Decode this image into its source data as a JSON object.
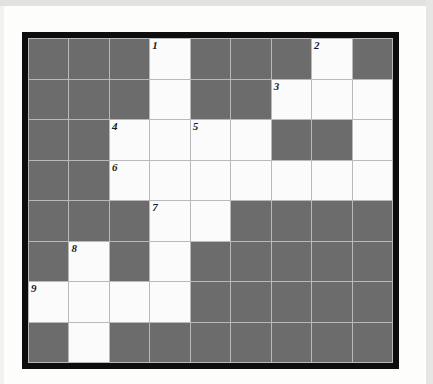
{
  "puzzle": {
    "type": "crossword-grid",
    "columns": 9,
    "rows": 8,
    "colors": {
      "block": "#6c6c6c",
      "open": "#fbfbfb",
      "gridline": "#b9b9b9",
      "frame": "#0d0d0d",
      "page": "#fdfdfb",
      "number_text": "#1a1a1a"
    },
    "clue_numbers": [
      "1",
      "2",
      "3",
      "4",
      "5",
      "6",
      "7",
      "8",
      "9"
    ],
    "rows_data": [
      {
        "index": 0,
        "cells": [
          {
            "state": "block",
            "number": ""
          },
          {
            "state": "block",
            "number": ""
          },
          {
            "state": "block",
            "number": ""
          },
          {
            "state": "open",
            "number": "1"
          },
          {
            "state": "block",
            "number": ""
          },
          {
            "state": "block",
            "number": ""
          },
          {
            "state": "block",
            "number": ""
          },
          {
            "state": "open",
            "number": "2"
          },
          {
            "state": "block",
            "number": ""
          }
        ]
      },
      {
        "index": 1,
        "cells": [
          {
            "state": "block",
            "number": ""
          },
          {
            "state": "block",
            "number": ""
          },
          {
            "state": "block",
            "number": ""
          },
          {
            "state": "open",
            "number": ""
          },
          {
            "state": "block",
            "number": ""
          },
          {
            "state": "block",
            "number": ""
          },
          {
            "state": "open",
            "number": "3"
          },
          {
            "state": "open",
            "number": ""
          },
          {
            "state": "open",
            "number": ""
          }
        ]
      },
      {
        "index": 2,
        "cells": [
          {
            "state": "block",
            "number": ""
          },
          {
            "state": "block",
            "number": ""
          },
          {
            "state": "open",
            "number": "4"
          },
          {
            "state": "open",
            "number": ""
          },
          {
            "state": "open",
            "number": "5"
          },
          {
            "state": "open",
            "number": ""
          },
          {
            "state": "block",
            "number": ""
          },
          {
            "state": "block",
            "number": ""
          },
          {
            "state": "open",
            "number": ""
          }
        ]
      },
      {
        "index": 3,
        "cells": [
          {
            "state": "block",
            "number": ""
          },
          {
            "state": "block",
            "number": ""
          },
          {
            "state": "open",
            "number": "6"
          },
          {
            "state": "open",
            "number": ""
          },
          {
            "state": "open",
            "number": ""
          },
          {
            "state": "open",
            "number": ""
          },
          {
            "state": "open",
            "number": ""
          },
          {
            "state": "open",
            "number": ""
          },
          {
            "state": "open",
            "number": ""
          }
        ]
      },
      {
        "index": 4,
        "cells": [
          {
            "state": "block",
            "number": ""
          },
          {
            "state": "block",
            "number": ""
          },
          {
            "state": "block",
            "number": ""
          },
          {
            "state": "open",
            "number": "7"
          },
          {
            "state": "open",
            "number": ""
          },
          {
            "state": "block",
            "number": ""
          },
          {
            "state": "block",
            "number": ""
          },
          {
            "state": "block",
            "number": ""
          },
          {
            "state": "block",
            "number": ""
          }
        ]
      },
      {
        "index": 5,
        "cells": [
          {
            "state": "block",
            "number": ""
          },
          {
            "state": "open",
            "number": "8"
          },
          {
            "state": "block",
            "number": ""
          },
          {
            "state": "open",
            "number": ""
          },
          {
            "state": "block",
            "number": ""
          },
          {
            "state": "block",
            "number": ""
          },
          {
            "state": "block",
            "number": ""
          },
          {
            "state": "block",
            "number": ""
          },
          {
            "state": "block",
            "number": ""
          }
        ]
      },
      {
        "index": 6,
        "cells": [
          {
            "state": "open",
            "number": "9"
          },
          {
            "state": "open",
            "number": ""
          },
          {
            "state": "open",
            "number": ""
          },
          {
            "state": "open",
            "number": ""
          },
          {
            "state": "block",
            "number": ""
          },
          {
            "state": "block",
            "number": ""
          },
          {
            "state": "block",
            "number": ""
          },
          {
            "state": "block",
            "number": ""
          },
          {
            "state": "block",
            "number": ""
          }
        ]
      },
      {
        "index": 7,
        "cells": [
          {
            "state": "block",
            "number": ""
          },
          {
            "state": "open",
            "number": ""
          },
          {
            "state": "block",
            "number": ""
          },
          {
            "state": "block",
            "number": ""
          },
          {
            "state": "block",
            "number": ""
          },
          {
            "state": "block",
            "number": ""
          },
          {
            "state": "block",
            "number": ""
          },
          {
            "state": "block",
            "number": ""
          },
          {
            "state": "block",
            "number": ""
          }
        ]
      }
    ]
  }
}
